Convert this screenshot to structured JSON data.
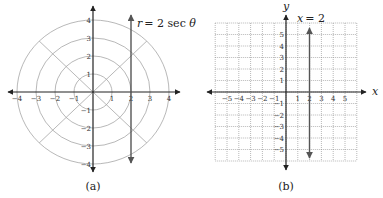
{
  "chart_data": [
    {
      "type": "line",
      "panel": "a",
      "caption": "(a)",
      "coordinate_system": "polar",
      "annotation": "r = 2 sec θ",
      "equation_parts": {
        "lhs": "r",
        "rhs": "= 2 sec θ"
      },
      "circles_r": [
        1,
        2,
        3,
        4
      ],
      "rays_deg": [
        0,
        45,
        90,
        135,
        180,
        225,
        270,
        315
      ],
      "x_ticks": [
        -4,
        -3,
        -2,
        -1,
        1,
        2,
        3,
        4
      ],
      "y_ticks": [
        4,
        3,
        2,
        1,
        -1,
        -2,
        -3,
        -4
      ],
      "xlim": [
        -4,
        4
      ],
      "ylim": [
        -4,
        4
      ],
      "series": [
        {
          "name": "r = 2 sec θ",
          "x": [
            2,
            2
          ],
          "y": [
            -4,
            4
          ],
          "style": "vertical line with arrows"
        }
      ],
      "grid": true
    },
    {
      "type": "line",
      "panel": "b",
      "caption": "(b)",
      "coordinate_system": "cartesian",
      "annotation": "x = 2",
      "xlabel": "x",
      "ylabel": "y",
      "x_ticks": [
        -5,
        -4,
        -3,
        -2,
        -1,
        1,
        2,
        3,
        4,
        5
      ],
      "y_ticks": [
        5,
        4,
        3,
        2,
        1,
        -1,
        -2,
        -3,
        -4,
        -5
      ],
      "xlim": [
        -6,
        6
      ],
      "ylim": [
        -6,
        6
      ],
      "series": [
        {
          "name": "x = 2",
          "x": [
            2,
            2
          ],
          "y": [
            -5.8,
            5.8
          ],
          "style": "vertical line with arrows"
        }
      ],
      "grid": true,
      "grid_style": "dotted"
    }
  ],
  "labels": {
    "a_x_ticks": [
      "−4",
      "−3",
      "−2",
      "−1",
      "1",
      "2",
      "3",
      "4"
    ],
    "a_y_ticks": [
      "4",
      "3",
      "2",
      "1",
      "−1",
      "−2",
      "−3",
      "−4"
    ],
    "b_x_ticks": [
      "−5",
      "−4",
      "−3",
      "−2",
      "−1",
      "1",
      "2",
      "3",
      "4",
      "5"
    ],
    "b_y_ticks": [
      "5",
      "4",
      "3",
      "2",
      "1",
      "−1",
      "−2",
      "−3",
      "−4",
      "−5"
    ]
  }
}
